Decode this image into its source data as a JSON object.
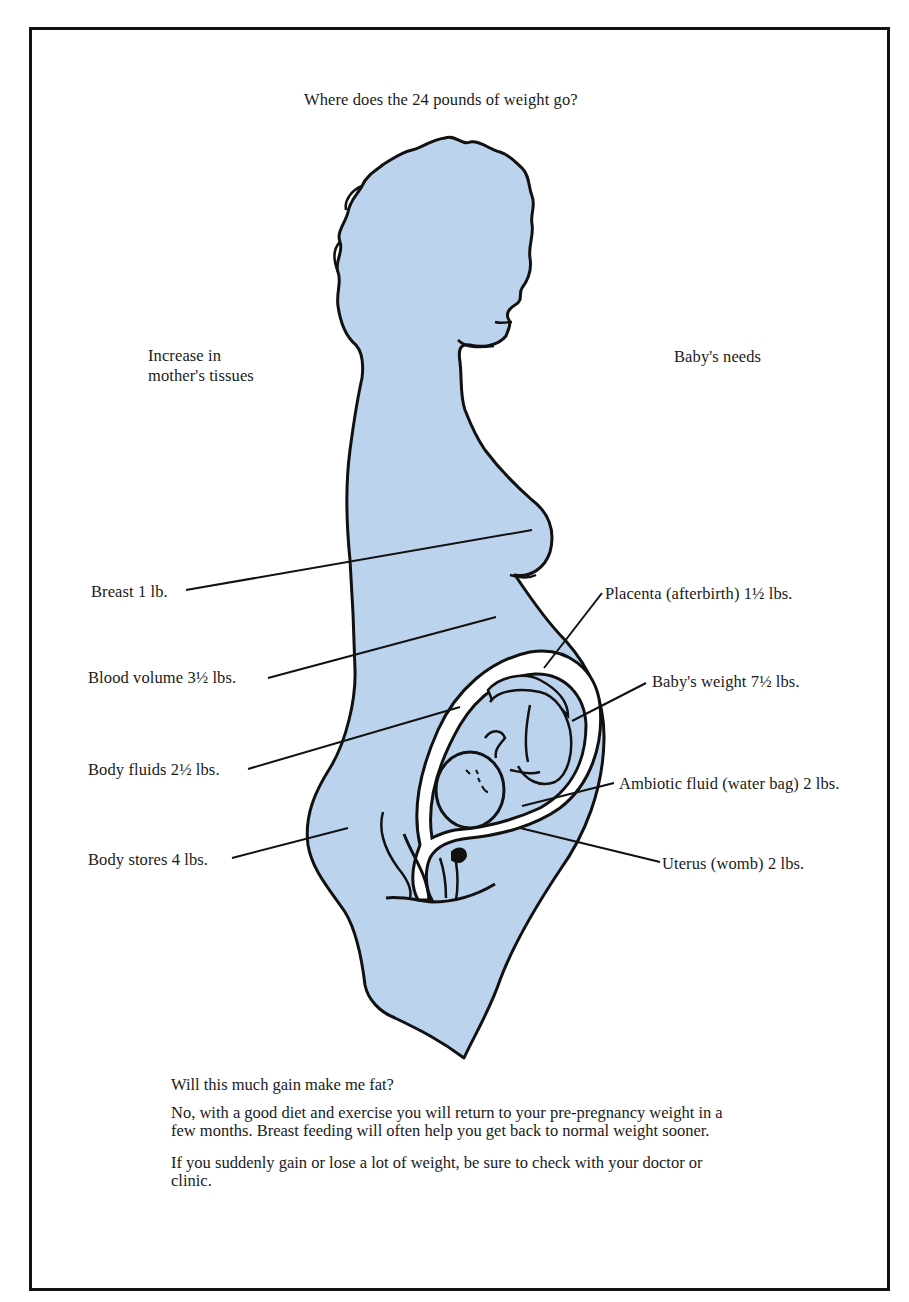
{
  "title": "Where does the 24 pounds of weight go?",
  "headings": {
    "left": "Increase in mother's tissues",
    "right": "Baby's needs"
  },
  "colors": {
    "silhouette_fill": "#bcd3ee",
    "outline": "#111111",
    "background": "#ffffff"
  },
  "labels_left": [
    {
      "text": "Breast 1 lb.",
      "item": "Breast",
      "weight_lbs": 1
    },
    {
      "text": "Blood volume 3½ lbs.",
      "item": "Blood volume",
      "weight_lbs": 3.5
    },
    {
      "text": "Body fluids 2½ lbs.",
      "item": "Body fluids",
      "weight_lbs": 2.5
    },
    {
      "text": "Body stores 4 lbs.",
      "item": "Body stores",
      "weight_lbs": 4
    }
  ],
  "labels_right": [
    {
      "text": "Placenta (afterbirth) 1½ lbs.",
      "item": "Placenta (afterbirth)",
      "weight_lbs": 1.5
    },
    {
      "text": "Baby's weight 7½ lbs.",
      "item": "Baby's weight",
      "weight_lbs": 7.5
    },
    {
      "text": "Ambiotic fluid (water bag) 2 lbs.",
      "item": "Ambiotic fluid (water bag)",
      "weight_lbs": 2
    },
    {
      "text": "Uterus (womb) 2 lbs.",
      "item": "Uterus (womb)",
      "weight_lbs": 2
    }
  ],
  "footer": {
    "question": "Will this much gain make me fat?",
    "answer": "No, with a good diet and exercise you will return to your pre-pregnancy weight in a few months. Breast feeding will often help you get back to normal weight sooner.",
    "advice": "If you suddenly gain or lose a lot of weight, be sure to check with your doctor or clinic."
  }
}
